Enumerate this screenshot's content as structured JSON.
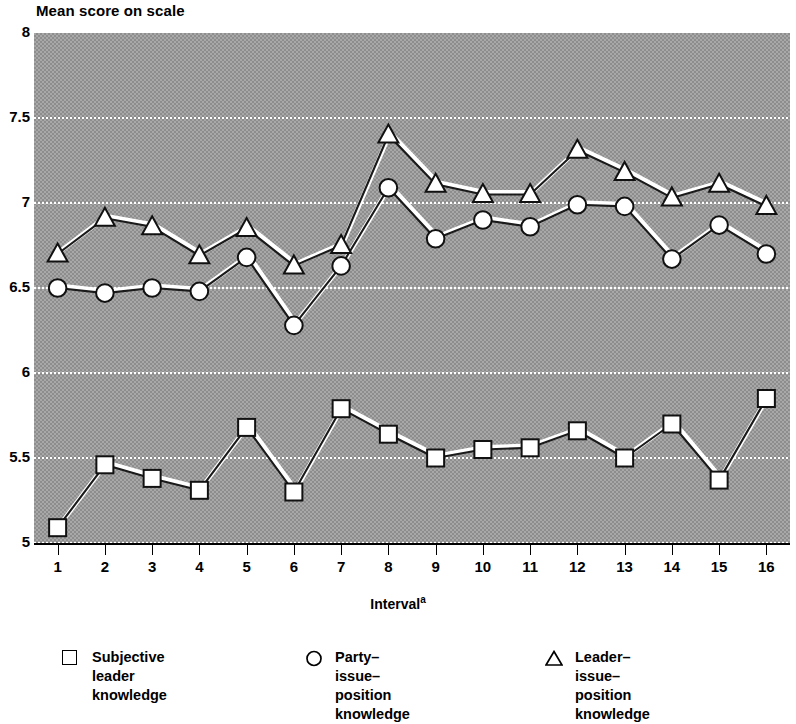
{
  "axes": {
    "y_title": "Mean score on scale",
    "x_title": "Interval",
    "x_title_superscript": "a",
    "y_ticks": [
      "8",
      "7.5",
      "7",
      "6.5",
      "6",
      "5.5",
      "5"
    ],
    "x_ticks": [
      "1",
      "2",
      "3",
      "4",
      "5",
      "6",
      "7",
      "8",
      "9",
      "10",
      "11",
      "12",
      "13",
      "14",
      "15",
      "16"
    ]
  },
  "legend": {
    "items": [
      {
        "marker": "square-marker-icon",
        "label": "Subjective leader\nknowledge"
      },
      {
        "marker": "circle-marker-icon",
        "label": "Party–issue–position\nknowledge"
      },
      {
        "marker": "triangle-marker-icon",
        "label": "Leader–issue–position\nknowledge"
      }
    ]
  },
  "chart_data": {
    "type": "line",
    "title": "",
    "xlabel": "Interval",
    "ylabel": "Mean score on scale",
    "xlim": [
      0.5,
      16.5
    ],
    "ylim": [
      5,
      8
    ],
    "ytick_step": 0.5,
    "grid": true,
    "legend_position": "bottom",
    "x": [
      1,
      2,
      3,
      4,
      5,
      6,
      7,
      8,
      9,
      10,
      11,
      12,
      13,
      14,
      15,
      16
    ],
    "series": [
      {
        "name": "Subjective leader knowledge",
        "marker": "square",
        "values": [
          5.09,
          5.46,
          5.38,
          5.31,
          5.68,
          5.3,
          5.79,
          5.64,
          5.5,
          5.55,
          5.56,
          5.66,
          5.5,
          5.7,
          5.37,
          5.85
        ]
      },
      {
        "name": "Party–issue–position knowledge",
        "marker": "circle",
        "values": [
          6.5,
          6.47,
          6.5,
          6.48,
          6.68,
          6.28,
          6.63,
          7.09,
          6.79,
          6.9,
          6.86,
          6.99,
          6.98,
          6.67,
          6.87,
          6.7
        ]
      },
      {
        "name": "Leader–issue–position knowledge",
        "marker": "triangle",
        "values": [
          6.7,
          6.91,
          6.86,
          6.69,
          6.85,
          6.63,
          6.75,
          7.4,
          7.11,
          7.05,
          7.05,
          7.31,
          7.18,
          7.03,
          7.11,
          6.98
        ]
      }
    ]
  }
}
